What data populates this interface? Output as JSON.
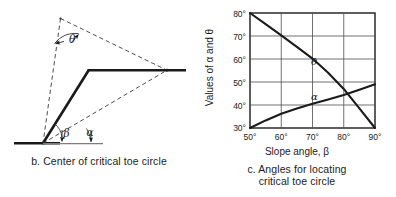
{
  "figure": {
    "panel_b": {
      "caption": "b. Center of critical toe circle",
      "labels": {
        "theta": "θ",
        "beta": "β",
        "alpha": "α"
      }
    },
    "panel_c": {
      "caption": "c. Angles for locating\ncritical toe circle"
    }
  },
  "chart_data": {
    "type": "line",
    "title": "c. Angles for locating critical toe circle",
    "xlabel": "Slope angle, β",
    "ylabel": "Values of α and θ",
    "xlim": [
      50,
      90
    ],
    "ylim": [
      30,
      80
    ],
    "xticks": [
      50,
      60,
      70,
      80,
      90
    ],
    "yticks": [
      30,
      40,
      50,
      60,
      70,
      80
    ],
    "xtick_labels": [
      "50°",
      "60°",
      "70°",
      "80°",
      "90°"
    ],
    "ytick_labels": [
      "30°",
      "40°",
      "50°",
      "60°",
      "70°",
      "80°"
    ],
    "grid": true,
    "legend": "inline-labels",
    "series": [
      {
        "name": "θ",
        "label": "θ",
        "label_at": {
          "x": 69.5,
          "y": 57.5
        },
        "x": [
          50,
          55,
          60,
          65,
          70,
          75,
          80,
          85,
          90
        ],
        "y": [
          80.0,
          75.2,
          70.3,
          65.3,
          60.2,
          54.0,
          47.0,
          38.5,
          30.0
        ]
      },
      {
        "name": "α",
        "label": "α",
        "label_at": {
          "x": 69.5,
          "y": 42.0
        },
        "x": [
          50,
          55,
          60,
          65,
          70,
          75,
          80,
          85,
          90
        ],
        "y": [
          30.0,
          33.3,
          36.2,
          38.5,
          40.5,
          42.4,
          44.3,
          46.6,
          49.0
        ]
      }
    ]
  },
  "diagram": {
    "name": "slope-stability-toe-circle",
    "elements": [
      "ground-line",
      "slope-face",
      "crest-line",
      "dashed-radius-left",
      "dashed-radius-right",
      "dashed-chord",
      "theta-angle-arc",
      "beta-angle-arc",
      "alpha-angle-arc"
    ]
  }
}
